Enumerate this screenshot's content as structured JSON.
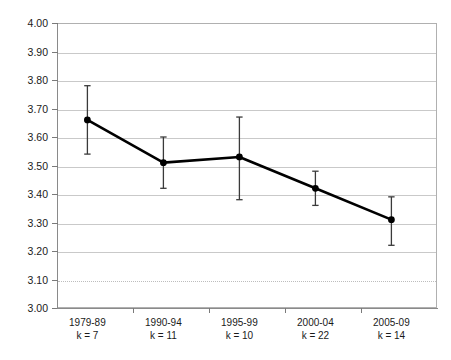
{
  "chart_data": {
    "type": "line",
    "title": "",
    "subtitle": "",
    "xlabel": "",
    "ylabel": "",
    "categories": [
      "1979-89",
      "1990-94",
      "1995-99",
      "2000-04",
      "2005-09"
    ],
    "category_sublabels": [
      "k = 7",
      "k = 11",
      "k = 10",
      "k = 22",
      "k = 14"
    ],
    "values": [
      3.66,
      3.51,
      3.53,
      3.42,
      3.31
    ],
    "error_low": [
      3.54,
      3.42,
      3.38,
      3.36,
      3.22
    ],
    "error_high": [
      3.78,
      3.6,
      3.67,
      3.48,
      3.39
    ],
    "series": [
      {
        "name": "mean",
        "values": [
          3.66,
          3.51,
          3.53,
          3.42,
          3.31
        ]
      }
    ],
    "ylim": [
      3.0,
      4.0
    ],
    "ytick_step": 0.1,
    "ytick_labels": [
      "4.00",
      "3.90",
      "3.80",
      "3.70",
      "3.60",
      "3.50",
      "3.40",
      "3.30",
      "3.20",
      "3.10",
      "3.00"
    ],
    "ytick_values": [
      4.0,
      3.9,
      3.8,
      3.7,
      3.6,
      3.5,
      3.4,
      3.3,
      3.2,
      3.1,
      3.0
    ],
    "grid": true,
    "dotted_gridline_value": 3.1,
    "legend": [],
    "legend_position": "none",
    "annotations": [],
    "colors": {
      "line": "#000000",
      "marker": "#000000",
      "error_bar": "#3a3a3a",
      "gridline": "#c9c9c9",
      "axis": "#8a8a8a",
      "background": "#ffffff",
      "text": "#1a1a1a"
    }
  }
}
